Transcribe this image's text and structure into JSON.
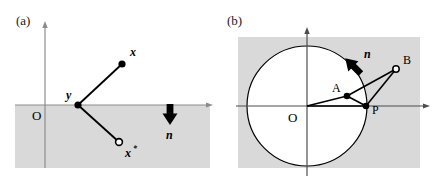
{
  "figure": {
    "background_color": "#ffffff",
    "shade_color": "#d9d9d9",
    "line_color": "#000000",
    "axis_color": "#808080"
  },
  "panels": [
    {
      "id": "a",
      "label": "(a)",
      "origin_label": "O",
      "shade_region": "lower-half-plane",
      "points": [
        {
          "name": "x",
          "label": "x",
          "marker": "filled",
          "cx": 122,
          "cy": 64,
          "lx": 130,
          "ly": 56
        },
        {
          "name": "y",
          "label": "y",
          "marker": "filled",
          "cx": 78,
          "cy": 105,
          "lx": 68,
          "ly": 98
        },
        {
          "name": "xstar",
          "label": "x",
          "star": "*",
          "marker": "open",
          "cx": 119,
          "cy": 142,
          "lx": 126,
          "ly": 155
        }
      ],
      "segments": [
        {
          "from": "y",
          "to": "x"
        },
        {
          "from": "y",
          "to": "xstar"
        }
      ],
      "normal_arrow": {
        "label": "n",
        "direction": "down",
        "x": 170,
        "y_start": 105,
        "y_end": 124,
        "lx": 166,
        "ly": 137
      }
    },
    {
      "id": "b",
      "label": "(b)",
      "origin_label": "O",
      "shade_region": "rectangle",
      "circle": {
        "cx": 307,
        "cy": 106,
        "r": 60
      },
      "points": [
        {
          "name": "A",
          "label": "A",
          "marker": "filled",
          "cx": 347,
          "cy": 96,
          "lx": 335,
          "ly": 90
        },
        {
          "name": "P",
          "label": "P",
          "marker": "filled",
          "cx": 366,
          "cy": 106,
          "lx": 373,
          "ly": 111
        },
        {
          "name": "B",
          "label": "B",
          "marker": "open",
          "cx": 396,
          "cy": 69,
          "lx": 404,
          "ly": 63
        }
      ],
      "segments": [
        {
          "from": "O",
          "to": "A"
        },
        {
          "from": "O",
          "to": "P"
        },
        {
          "from": "A",
          "to": "B"
        },
        {
          "from": "A",
          "to": "P"
        },
        {
          "from": "P",
          "to": "B"
        }
      ],
      "normal_arrow": {
        "label": "n",
        "direction": "up-right",
        "x_start": 345,
        "y_start": 75,
        "x_end": 362,
        "y_end": 58,
        "lx": 366,
        "ly": 55
      }
    }
  ]
}
